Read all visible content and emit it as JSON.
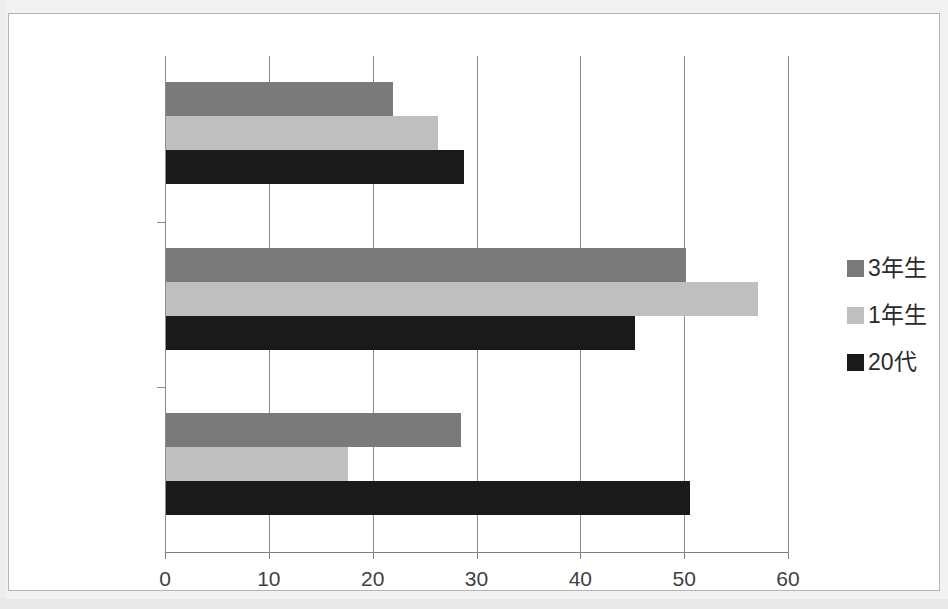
{
  "chart_data": {
    "type": "bar",
    "orientation": "horizontal",
    "title": "",
    "xlabel": "",
    "ylabel": "",
    "categories": [
      "20〜25%",
      "15%",
      "0%"
    ],
    "series": [
      {
        "name": "3年生",
        "color": "#7a7a7a",
        "values": [
          21.9,
          50.1,
          28.4
        ]
      },
      {
        "name": "1年生",
        "color": "#bfbfbf",
        "values": [
          26.2,
          57.0,
          17.5
        ]
      },
      {
        "name": "20代",
        "color": "#1a1a1a",
        "values": [
          28.7,
          45.2,
          50.5
        ]
      }
    ],
    "xlim": [
      0,
      60
    ],
    "xticks": [
      0,
      10,
      20,
      30,
      40,
      50,
      60
    ],
    "xtick_labels": [
      "0",
      "10",
      "20",
      "30",
      "40",
      "50",
      "60"
    ],
    "grid": "vertical",
    "legend_position": "right"
  },
  "legend": {
    "items": [
      {
        "label": "3年生",
        "color": "#7a7a7a"
      },
      {
        "label": "1年生",
        "color": "#bfbfbf"
      },
      {
        "label": "20代",
        "color": "#1a1a1a"
      }
    ]
  }
}
